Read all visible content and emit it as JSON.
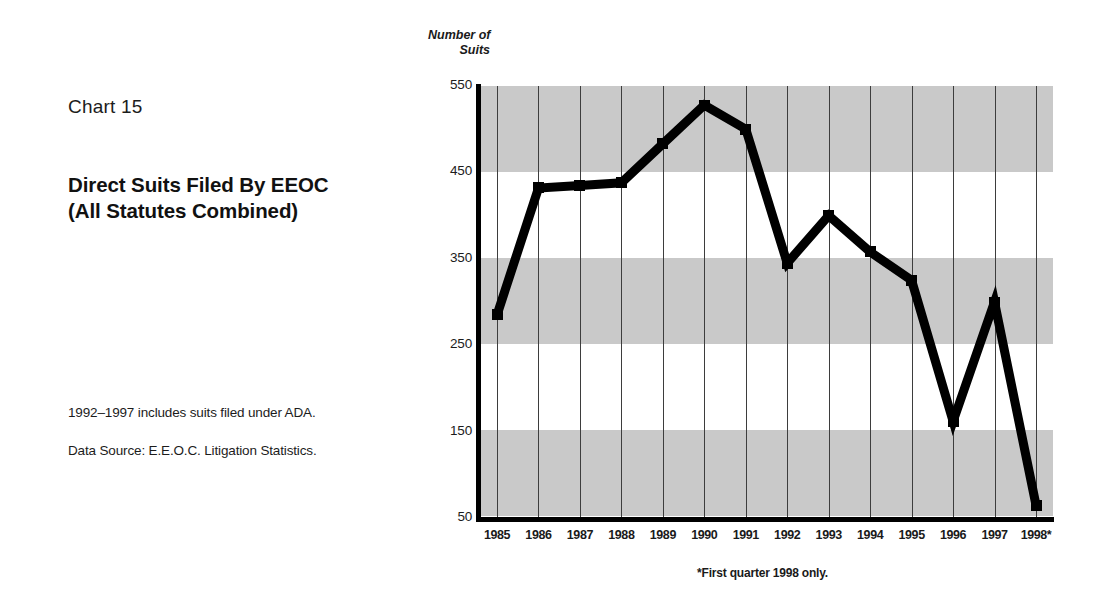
{
  "left_panel": {
    "chart_number": "Chart 15",
    "title_line_1": "Direct Suits Filed By EEOC",
    "title_line_2": "(All Statutes Combined)",
    "note_1": "1992–1997 includes suits filed under ADA.",
    "note_2": "Data Source: E.E.O.C. Litigation Statistics."
  },
  "plot": {
    "y_caption_line_1": "Number of",
    "y_caption_line_2": "Suits",
    "footnote": "*First quarter 1998 only."
  },
  "chart_data": {
    "type": "line",
    "title": "Direct Suits Filed By EEOC (All Statutes Combined)",
    "xlabel": "",
    "ylabel": "Number of Suits",
    "categories": [
      "1985",
      "1986",
      "1987",
      "1988",
      "1989",
      "1990",
      "1991",
      "1992",
      "1993",
      "1994",
      "1995",
      "1996",
      "1997",
      "1998*"
    ],
    "values": [
      285,
      432,
      435,
      438,
      483,
      528,
      500,
      345,
      400,
      358,
      325,
      162,
      300,
      65
    ],
    "ylim": [
      50,
      550
    ],
    "yticks": [
      550,
      450,
      350,
      250,
      150,
      50
    ],
    "grid": "vertical-lines-plus-horizontal-gray-bands",
    "legend": "none",
    "marker": "square",
    "line_color": "#000000",
    "band_color": "#c9c9c9",
    "annotations": [
      "*First quarter 1998 only.",
      "1992–1997 includes suits filed under ADA."
    ]
  }
}
